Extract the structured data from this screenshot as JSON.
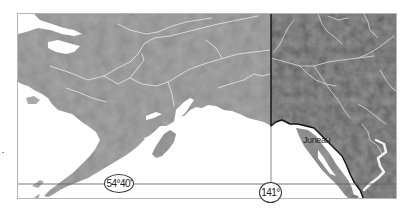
{
  "map": {
    "title": "Alaska and Canada boundary map",
    "regions": [
      {
        "name": "Alaska",
        "fill": "#a9a9a9"
      },
      {
        "name": "Canada",
        "fill": "#5c5c5c"
      }
    ],
    "water_color": "#ffffff",
    "river_color": "#d8d8d8",
    "boundary_color": "#111111"
  },
  "labels": {
    "city": "Juneau",
    "parallel": "54°40′",
    "meridian": "141°"
  },
  "gridlines": {
    "parallel_label": "54°40′ parallel",
    "meridian_label": "141° meridian"
  }
}
